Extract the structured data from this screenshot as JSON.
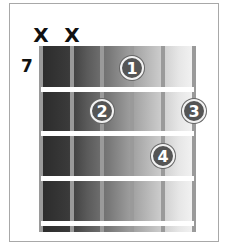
{
  "diagram": {
    "type": "guitar-chord-diagram",
    "start_fret": "7",
    "strings_count": 6,
    "frets_shown": 4,
    "muted_strings": [
      {
        "string": 1,
        "symbol": "X"
      },
      {
        "string": 2,
        "symbol": "X"
      }
    ],
    "fingers": [
      {
        "finger": "1",
        "string": 4,
        "fret": 1
      },
      {
        "finger": "2",
        "string": 3,
        "fret": 2
      },
      {
        "finger": "3",
        "string": 6,
        "fret": 2
      },
      {
        "finger": "4",
        "string": 5,
        "fret": 3
      }
    ],
    "colors": {
      "frame": "#a8a8a8",
      "board_dark": "#2b2b2b",
      "board_light": "#f3f3f3",
      "string": "#9a9a9a",
      "fret": "#ffffff",
      "dot_fill": "#555555",
      "dot_ring": "#f2f2f2",
      "text": "#111111"
    }
  }
}
